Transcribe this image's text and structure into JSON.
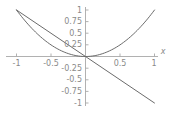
{
  "chart_data": {
    "type": "line",
    "title": "",
    "subtitle": "",
    "xlabel": "x",
    "ylabel": "",
    "xlim": [
      -1.15,
      1.15
    ],
    "ylim": [
      -1.1,
      1.1
    ],
    "grid": false,
    "legend": "none",
    "x_ticks": [
      {
        "value": -1,
        "label": "-1"
      },
      {
        "value": -0.5,
        "label": "-0.5"
      },
      {
        "value": 0.5,
        "label": "0.5"
      },
      {
        "value": 1,
        "label": "1"
      }
    ],
    "y_ticks": [
      {
        "value": 1,
        "label": "1"
      },
      {
        "value": 0.75,
        "label": "0.75"
      },
      {
        "value": 0.5,
        "label": "0.5"
      },
      {
        "value": 0.25,
        "label": "0.25"
      },
      {
        "value": -0.25,
        "label": "-0.25"
      },
      {
        "value": -0.5,
        "label": "-0.5"
      },
      {
        "value": -0.75,
        "label": "-0.75"
      },
      {
        "value": -1,
        "label": "-1"
      }
    ],
    "series": [
      {
        "name": "parabola",
        "expression": "y = x^2",
        "color": "#6b6b6b",
        "x": [
          -1,
          -0.9,
          -0.8,
          -0.7,
          -0.6,
          -0.5,
          -0.4,
          -0.3,
          -0.2,
          -0.1,
          0,
          0.1,
          0.2,
          0.3,
          0.4,
          0.5,
          0.6,
          0.7,
          0.8,
          0.9,
          1
        ],
        "values": [
          1,
          0.81,
          0.64,
          0.49,
          0.36,
          0.25,
          0.16,
          0.09,
          0.04,
          0.01,
          0,
          0.01,
          0.04,
          0.09,
          0.16,
          0.25,
          0.36,
          0.49,
          0.64,
          0.81,
          1
        ]
      },
      {
        "name": "line",
        "expression": "y = -x",
        "color": "#6b6b6b",
        "x": [
          -1,
          1
        ],
        "values": [
          1,
          -1
        ]
      }
    ],
    "axis_color": "#a8a8a8",
    "tick_label_color": "#8a8a8a",
    "background": "#ffffff"
  },
  "labels": {
    "x_axis_name": "x",
    "xt_neg1": "-1",
    "xt_neg_half": "-0.5",
    "xt_half": "0.5",
    "xt_one": "1",
    "yt_1": "1",
    "yt_075": "0.75",
    "yt_05": "0.5",
    "yt_025": "0.25",
    "yt_neg025": "-0.25",
    "yt_neg05": "-0.5",
    "yt_neg075": "-0.75",
    "yt_neg1": "-1"
  }
}
